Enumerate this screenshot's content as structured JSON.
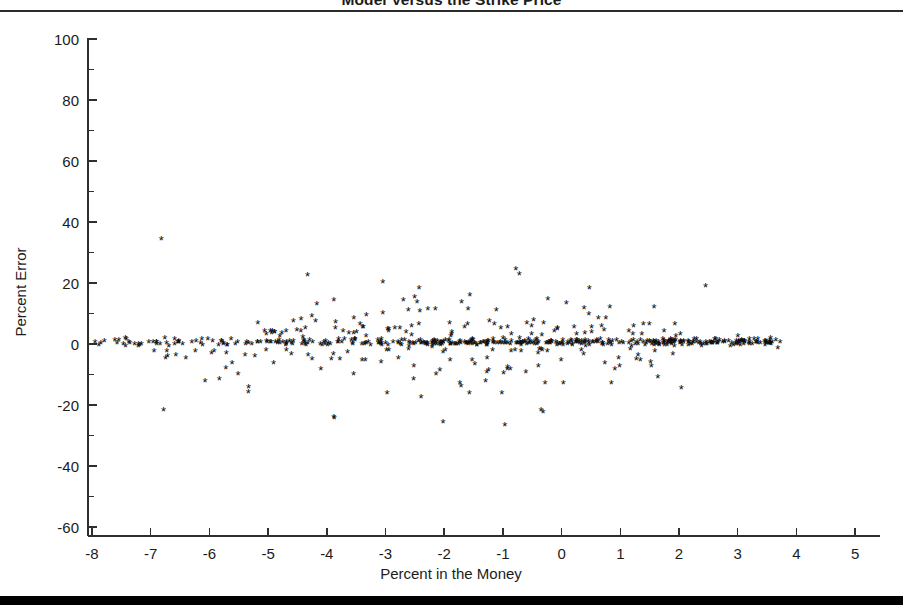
{
  "figure": {
    "title": "Model Versus the Strike Price",
    "title_clipped": true
  },
  "rules": {
    "top_rule": "thin-horizontal-rule",
    "bottom_rule": "thick-horizontal-rule"
  },
  "chart_data": {
    "type": "scatter",
    "title": "Model Versus the Strike Price",
    "xlabel": "Percent in the Money",
    "ylabel": "Percent Error",
    "xlim": [
      -8.4,
      5.4
    ],
    "ylim": [
      -63,
      108
    ],
    "xticks": [
      -8,
      -7,
      -6,
      -5,
      -4,
      -3,
      -2,
      -1,
      0,
      1,
      2,
      3,
      4,
      5
    ],
    "xtick_labels": [
      "-8",
      "-7",
      "-6",
      "-5",
      "-4",
      "-3",
      "-2",
      "-1",
      "0",
      "1",
      "2",
      "3",
      "4",
      "5"
    ],
    "yticks": [
      -60,
      -40,
      -20,
      0,
      20,
      40,
      60,
      80,
      100
    ],
    "ytick_labels": [
      "-60",
      "-40",
      "-20",
      "0",
      "20",
      "40",
      "60",
      "80",
      "100"
    ],
    "y_minor_ticks": [
      -50,
      -30,
      -10,
      10,
      30,
      50,
      70,
      90
    ],
    "grid": false,
    "legend": false,
    "marker": "asterisk",
    "marker_color": "#0d0d0d",
    "axis_color": "#2f2f2f",
    "series_name": "Percent Error vs Percent in the Money",
    "n_points": 620,
    "notable_points": [
      {
        "x": -6.82,
        "y": 34.0,
        "note": "highest outlier"
      },
      {
        "x": -4.33,
        "y": 22.0,
        "note": "upper outlier left region"
      },
      {
        "x": -0.78,
        "y": 24.0,
        "note": "upper cluster max"
      },
      {
        "x": 2.45,
        "y": 18.5,
        "note": "isolated right upper point"
      },
      {
        "x": -0.97,
        "y": -27.0,
        "note": "lowest outlier"
      },
      {
        "x": -3.88,
        "y": -24.5,
        "note": "low outlier"
      },
      {
        "x": -6.78,
        "y": -22.0,
        "note": "low outlier left"
      },
      {
        "x": -7.95,
        "y": 0.0,
        "note": "leftmost point"
      },
      {
        "x": 3.72,
        "y": 0.0,
        "note": "rightmost point"
      }
    ]
  }
}
